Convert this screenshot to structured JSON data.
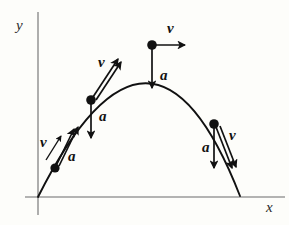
{
  "figure": {
    "background_color": "#fdfdfa",
    "curve_color": "#111111",
    "axis_color": "#9a9a9a",
    "axes": {
      "x_label": "x",
      "y_label": "y",
      "x_label_pos": [
        266,
        212
      ],
      "y_label_pos": [
        16,
        30
      ],
      "x_axis": [
        25,
        197,
        285,
        197
      ],
      "y_axis": [
        38,
        12,
        38,
        215
      ]
    },
    "trajectory": {
      "description": "parabolic arc from origin through apex and down below x-axis",
      "path": "M 38 197 Q 152 -30 240 196",
      "start": [
        38,
        197
      ],
      "apex": [
        152,
        45
      ],
      "end": [
        240,
        196
      ]
    },
    "points": [
      {
        "id": "point-1",
        "name": "ascending-early",
        "dot": [
          55,
          168
        ],
        "v_label": "v",
        "v_label_pos": [
          40,
          147
        ],
        "v_arrow": [
          46,
          160,
          61,
          136
        ],
        "a_label": "a",
        "a_label_pos": [
          68,
          161
        ],
        "a_arrow": [
          55,
          168,
          72,
          129
        ],
        "tangent_arrow": [
          59,
          166,
          78,
          127
        ]
      },
      {
        "id": "point-2",
        "name": "ascending-late",
        "dot": [
          91,
          100
        ],
        "v_label": "v",
        "v_label_pos": [
          98,
          67
        ],
        "v_arrow": [
          93,
          97,
          118,
          59
        ],
        "a_label": "a",
        "a_label_pos": [
          99,
          121
        ],
        "a_arrow": [
          91,
          101,
          91,
          138
        ],
        "tangent_arrow": [
          96,
          100,
          121,
          62
        ]
      },
      {
        "id": "point-3",
        "name": "apex",
        "dot": [
          152,
          45
        ],
        "v_label": "v",
        "v_label_pos": [
          167,
          33
        ],
        "v_arrow": [
          152,
          45,
          185,
          45
        ],
        "a_label": "a",
        "a_label_pos": [
          160,
          80
        ],
        "a_arrow": [
          152,
          46,
          152,
          88
        ],
        "tangent_arrow": null
      },
      {
        "id": "point-4",
        "name": "descending",
        "dot": [
          214,
          124
        ],
        "v_label": "v",
        "v_label_pos": [
          229,
          140
        ],
        "v_arrow": [
          216,
          127,
          232,
          168
        ],
        "a_label": "a",
        "a_label_pos": [
          202,
          152
        ],
        "a_arrow": [
          214,
          126,
          214,
          168
        ],
        "tangent_arrow": [
          220,
          126,
          236,
          167
        ]
      }
    ],
    "legend_note": {
      "v_meaning": "velocity vector, tangent to trajectory",
      "a_meaning": "acceleration vector, constant downward"
    }
  }
}
